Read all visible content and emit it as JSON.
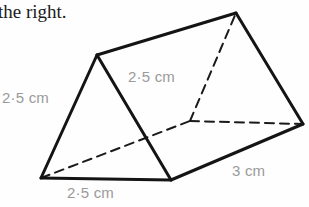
{
  "page": {
    "background_color": "#fefefe",
    "width": 309,
    "height": 207
  },
  "caption": {
    "text": "the right."
  },
  "figure": {
    "name": "triangular-prism",
    "stroke_color": "#1a1a1a",
    "hidden_stroke_color": "#1a1a1a",
    "label_color": "#9a9a9a",
    "vertices": {
      "front_bottom_left": [
        41,
        178
      ],
      "front_bottom_right": [
        171,
        180
      ],
      "front_apex": [
        97,
        55
      ],
      "back_bottom_left": [
        190,
        121
      ],
      "back_bottom_right": [
        303,
        124
      ],
      "back_apex": [
        236,
        13
      ]
    },
    "solid_edges": [
      [
        "front_bottom_left",
        "front_bottom_right"
      ],
      [
        "front_bottom_right",
        "front_apex"
      ],
      [
        "front_apex",
        "front_bottom_left"
      ],
      [
        "front_apex",
        "back_apex"
      ],
      [
        "front_bottom_right",
        "back_bottom_right"
      ],
      [
        "back_apex",
        "back_bottom_right"
      ]
    ],
    "hidden_edges": [
      [
        "front_bottom_left",
        "back_bottom_left"
      ],
      [
        "back_bottom_left",
        "back_bottom_right"
      ],
      [
        "back_bottom_left",
        "back_apex"
      ]
    ]
  },
  "labels": {
    "left_side": "2·5 cm",
    "slant_face": "2·5 cm",
    "bottom_edge": "2·5 cm",
    "depth_edge": "3 cm"
  }
}
